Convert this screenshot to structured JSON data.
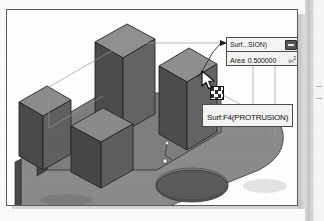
{
  "figure": {
    "kind": "cad-3d-isometric-model",
    "model_name": "Surf:F4(PROTRUSION)"
  },
  "callout": {
    "title": "Surf...SION)",
    "collapse_icon": "minimize-icon",
    "area_label": "Area",
    "area_value": "0.500000",
    "area_unit": "in",
    "area_unit_exponent": "2"
  },
  "tooltip": {
    "text": "Surf:F4(PROTRUSION)"
  },
  "cursor": {
    "icon": "arrow-pointer-icon"
  },
  "pick_handle": {
    "icon": "selection-handle-icon"
  },
  "colors": {
    "face_top": "#8e8e8e",
    "face_left": "#4b4b4b",
    "face_right": "#6e6e6e",
    "base_top": "#9a9a9a",
    "outline": "#2b2b2b",
    "hidden_edge": "#8a8a8a",
    "callout_bg": "#f2f2f0",
    "callout_border": "#4a4a4a",
    "page_bg": "#fbfbfa"
  },
  "page_edge_marks": [
    {
      "top": 86
    },
    {
      "top": 98
    }
  ]
}
